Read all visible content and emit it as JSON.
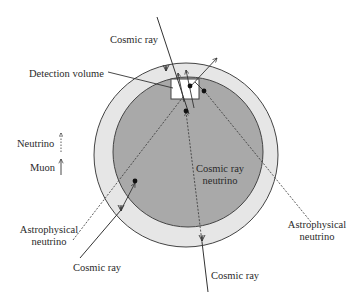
{
  "diagram": {
    "type": "neutrino-detection-schematic",
    "colors": {
      "background": "#ffffff",
      "outer_ring": "#e6e6e6",
      "inner_core": "#a9a9a9",
      "detection_box": "#ffffff",
      "lines": "#333333",
      "dots": "#111111"
    },
    "labels": {
      "cosmic_ray_top": "Cosmic ray",
      "detection_volume": "Detection volume",
      "legend_neutrino": "Neutrino",
      "legend_muon": "Muon",
      "astro_left_line1": "Astrophysical",
      "astro_left_line2": "neutrino",
      "astro_right_line1": "Astrophysical",
      "astro_right_line2": "neutrino",
      "cosmic_ray_neutrino_line1": "Cosmic ray",
      "cosmic_ray_neutrino_line2": "neutrino",
      "cosmic_ray_bottom_left": "Cosmic ray",
      "cosmic_ray_bottom": "Cosmic ray"
    },
    "legend": [
      {
        "label": "Neutrino",
        "style": "dashed-arrow"
      },
      {
        "label": "Muon",
        "style": "solid-arrow"
      }
    ],
    "regions": [
      {
        "name": "outer-atmosphere-ring",
        "shape": "circle"
      },
      {
        "name": "earth-core",
        "shape": "circle"
      },
      {
        "name": "detection-volume",
        "shape": "rectangle"
      }
    ]
  }
}
